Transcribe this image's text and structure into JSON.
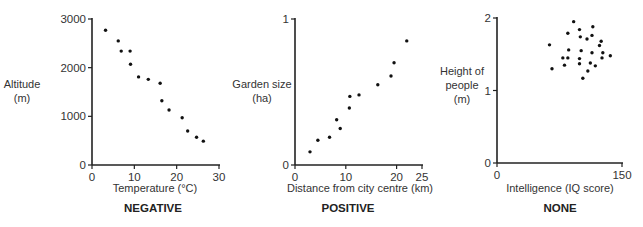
{
  "chart_data": [
    {
      "type": "scatter",
      "title": "NEGATIVE",
      "xlabel": "Temperature (°C)",
      "ylabel": "Altitude (m)",
      "ylabel_lines": [
        "Altitude",
        "(m)"
      ],
      "xlim": [
        0,
        30
      ],
      "ylim": [
        0,
        3000
      ],
      "xticks": [
        0,
        10,
        20,
        30
      ],
      "yticks": [
        0,
        1000,
        2000,
        3000
      ],
      "grid": false,
      "points": [
        [
          3.2,
          2770
        ],
        [
          6.2,
          2550
        ],
        [
          6.9,
          2340
        ],
        [
          9.0,
          2340
        ],
        [
          9.1,
          2070
        ],
        [
          11.0,
          1810
        ],
        [
          13.3,
          1760
        ],
        [
          16.1,
          1680
        ],
        [
          16.5,
          1320
        ],
        [
          18.2,
          1130
        ],
        [
          21.3,
          970
        ],
        [
          22.6,
          700
        ],
        [
          24.7,
          570
        ],
        [
          26.3,
          490
        ]
      ]
    },
    {
      "type": "scatter",
      "title": "POSITIVE",
      "xlabel": "Distance from city centre (km)",
      "ylabel": "Garden size (ha)",
      "ylabel_lines": [
        "Garden size",
        "(ha)"
      ],
      "xlim": [
        0,
        25
      ],
      "ylim": [
        0,
        1
      ],
      "xticks": [
        0,
        10,
        20,
        25
      ],
      "yticks": [
        0,
        1
      ],
      "grid": false,
      "points": [
        [
          2.95,
          0.09
        ],
        [
          4.5,
          0.17
        ],
        [
          6.8,
          0.19
        ],
        [
          8.2,
          0.31
        ],
        [
          8.9,
          0.25
        ],
        [
          10.7,
          0.39
        ],
        [
          10.8,
          0.47
        ],
        [
          12.6,
          0.48
        ],
        [
          16.3,
          0.55
        ],
        [
          18.9,
          0.61
        ],
        [
          19.5,
          0.7
        ],
        [
          22.0,
          0.85
        ]
      ]
    },
    {
      "type": "scatter",
      "title": "NONE",
      "xlabel": "Intelligence (IQ score)",
      "ylabel": "Height of people (m)",
      "ylabel_lines": [
        "Height of",
        "people",
        "(m)"
      ],
      "xlim": [
        0,
        150
      ],
      "ylim": [
        0,
        2
      ],
      "xticks": [
        0,
        150
      ],
      "yticks": [
        0,
        1,
        2
      ],
      "grid": false,
      "points": [
        [
          92,
          1.95
        ],
        [
          99,
          1.84
        ],
        [
          115,
          1.88
        ],
        [
          85,
          1.79
        ],
        [
          100,
          1.74
        ],
        [
          114,
          1.76
        ],
        [
          108,
          1.71
        ],
        [
          125,
          1.68
        ],
        [
          123,
          1.62
        ],
        [
          63,
          1.63
        ],
        [
          86,
          1.56
        ],
        [
          85,
          1.45
        ],
        [
          101,
          1.55
        ],
        [
          114,
          1.52
        ],
        [
          127,
          1.52
        ],
        [
          136,
          1.48
        ],
        [
          126,
          1.45
        ],
        [
          79,
          1.45
        ],
        [
          99,
          1.44
        ],
        [
          81,
          1.35
        ],
        [
          99,
          1.37
        ],
        [
          112,
          1.38
        ],
        [
          118,
          1.34
        ],
        [
          66,
          1.3
        ],
        [
          109,
          1.27
        ],
        [
          103,
          1.17
        ]
      ]
    }
  ]
}
